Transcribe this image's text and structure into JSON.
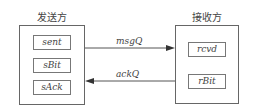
{
  "sender": {
    "title": "发送方",
    "fields": [
      "sent",
      "sBit",
      "sAck"
    ]
  },
  "receiver": {
    "title": "接收方",
    "fields": [
      "rcvd",
      "rBit"
    ]
  },
  "channels": {
    "msg": "msgQ",
    "ack": "ackQ"
  }
}
